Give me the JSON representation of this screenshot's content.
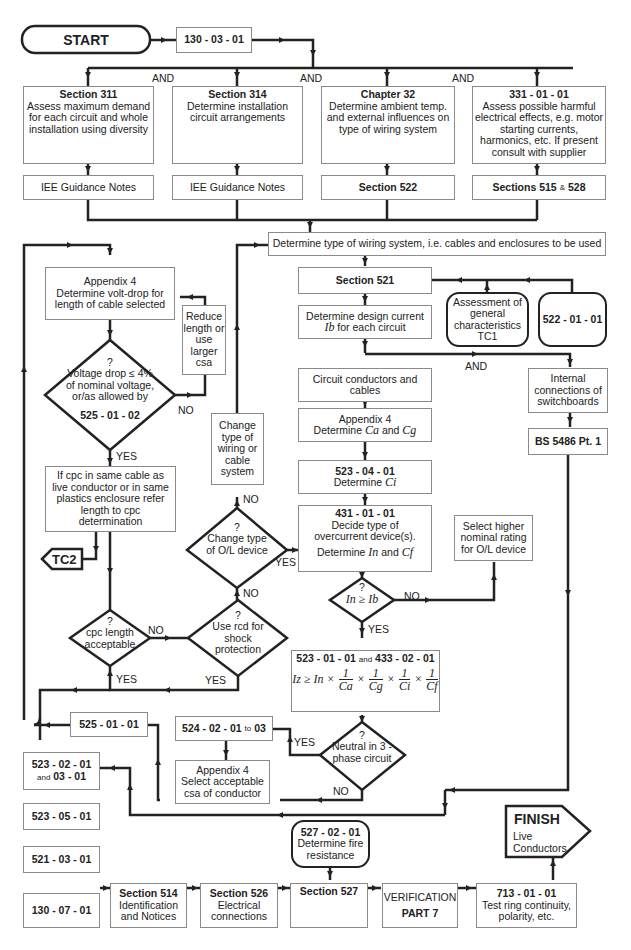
{
  "start": {
    "label": "START"
  },
  "reg_130_03_01": {
    "label": "130 - 03 - 01"
  },
  "and_labels": [
    "AND",
    "AND",
    "AND",
    "AND"
  ],
  "top_boxes": [
    {
      "heading": "Section  311",
      "text": "Assess maximum demand for each circuit and whole installation using diversity",
      "ref": "IEE Guidance Notes"
    },
    {
      "heading": "Section  314",
      "text": "Determine installation circuit arrangements",
      "ref": "IEE Guidance Notes"
    },
    {
      "heading": "Chapter  32",
      "text": "Determine ambient temp. and external influences on type of wiring system",
      "ref": "Section  522"
    },
    {
      "heading": "331 - 01 - 01",
      "text": "Assess possible harmful electrical effects, e.g. motor starting currents, harmonics, etc. If present consult with supplier",
      "ref_parts": [
        "Sections 515",
        "&",
        "528"
      ]
    }
  ],
  "wiring_system": {
    "text": "Determine type of wiring system, i.e. cables and enclosures to be used"
  },
  "section_521": {
    "label": "Section  521"
  },
  "assessment_tc1": {
    "text": "Assessment of general characteristics TC1"
  },
  "reg_522_01_01": {
    "label": "522 - 01 - 01"
  },
  "design_current": {
    "text_before": "Determine design current",
    "symbol": "Ib",
    "text_after": "for each circuit"
  },
  "and_mid": "AND",
  "circuit_conductors": {
    "text": "Circuit conductors and cables"
  },
  "internal_connections": {
    "text": "Internal connections of switchboards"
  },
  "bs_5486": {
    "label": "BS 5486  Pt. 1"
  },
  "appendix4_ca_cg": {
    "heading": "Appendix 4",
    "text": "Determine",
    "sym1": "Ca",
    "and": "and",
    "sym2": "Cg"
  },
  "reg_523_04_01": {
    "heading": "523 - 04 - 01",
    "text": "Determine",
    "sym": "Ci"
  },
  "reg_431_01_01": {
    "heading": "431 - 01 - 01",
    "text": "Decide type of overcurrent device(s).",
    "text2": "Determine",
    "sym1": "In",
    "and": "and",
    "sym2": "Cf"
  },
  "select_higher": {
    "text": "Select higher nominal rating for O/L device"
  },
  "decision_in_ib": {
    "q": "?",
    "expr": "In ≥ Ib",
    "no": "NO",
    "yes": "YES"
  },
  "formula_box": {
    "heading_a": "523 - 01 - 01",
    "and": "and",
    "heading_b": "433 - 02 - 01",
    "lhs": "Iz ≥ In ×",
    "terms": [
      "Ca",
      "Cg",
      "Ci",
      "Cf"
    ],
    "numerator": "1",
    "times": "×"
  },
  "decision_neutral": {
    "q": "?",
    "text": "Neutral in 3 - phase circuit",
    "yes": "YES",
    "no": "NO"
  },
  "reg_524_02_01": {
    "label_a": "524 - 02 - 01",
    "to": "to",
    "label_b": "03"
  },
  "appendix4_csa": {
    "heading": "Appendix 4",
    "text": "Select acceptable csa of conductor"
  },
  "appendix4_voltdrop": {
    "heading": "Appendix 4",
    "text": "Determine volt-drop for length of cable selected"
  },
  "reduce_length": {
    "text": "Reduce length or use larger csa"
  },
  "decision_voltage": {
    "q": "?",
    "text": "Voltage drop ≤ 4% of nominal voltage, or/as allowed by",
    "ref": "525 - 01 - 02",
    "no": "NO",
    "yes": "YES"
  },
  "cpc_box": {
    "text": "If cpc in same cable as live conductor or in same plastics enclosure refer length to cpc determination"
  },
  "tc2": {
    "label": "TC2"
  },
  "decision_cpc": {
    "q": "?",
    "text": "cpc length acceptable",
    "no": "NO",
    "yes": "YES"
  },
  "decision_rcd": {
    "q": "?",
    "text": "Use rcd for shock protection",
    "no": "NO",
    "yes": "YES"
  },
  "decision_ol": {
    "q": "?",
    "text": "Change type of O/L device",
    "no": "NO",
    "yes": "YES"
  },
  "change_wiring": {
    "text": "Change type of wiring or cable system"
  },
  "reg_525_01_01": {
    "label": "525 - 01 - 01"
  },
  "reg_523_02_01": {
    "label_a": "523 - 02 - 01",
    "and": "and",
    "label_b": "03 - 01"
  },
  "reg_523_05_01": {
    "label": "523 - 05 - 01"
  },
  "reg_521_03_01": {
    "label": "521 - 03 - 01"
  },
  "reg_130_07_01": {
    "label": "130 - 07 - 01"
  },
  "section_514": {
    "heading": "Section  514",
    "text": "Identification and Notices"
  },
  "section_526": {
    "heading": "Section  526",
    "text": "Electrical connections"
  },
  "section_527": {
    "heading": "Section  527"
  },
  "reg_527_02_01": {
    "heading": "527 - 02 - 01",
    "text": "Determine fire resistance"
  },
  "verification": {
    "text": "VERIFICATION",
    "part": "PART 7"
  },
  "reg_713_01_01": {
    "heading": "713 - 01 - 01",
    "text": "Test ring continuity, polarity, etc."
  },
  "finish": {
    "label": "FINISH",
    "text": "Live Conductors"
  }
}
